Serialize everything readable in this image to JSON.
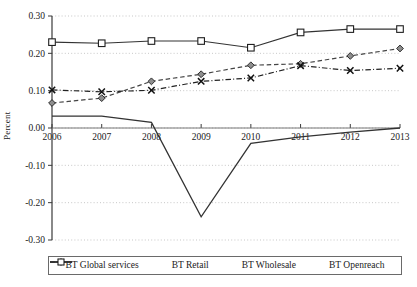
{
  "chart_data": {
    "type": "line",
    "title": "",
    "xlabel": "",
    "ylabel": "Percent",
    "x": [
      2006,
      2007,
      2008,
      2009,
      2010,
      2011,
      2012,
      2013
    ],
    "xtick_labels": [
      "2006",
      "2007",
      "2008",
      "2009",
      "2010",
      "2011",
      "2012",
      "2013"
    ],
    "ytick_labels": [
      "0.30",
      "0.20",
      "0.10",
      "0.00",
      "-0.10",
      "-0.20",
      "-0.30"
    ],
    "ytick_values": [
      0.3,
      0.2,
      0.1,
      0.0,
      -0.1,
      -0.2,
      -0.3
    ],
    "ylim": [
      -0.3,
      0.3
    ],
    "xlim": [
      2006,
      2013
    ],
    "grid": "horizontal-dotted",
    "legend_position": "bottom",
    "series": [
      {
        "name": "BT Global services",
        "style": "solid",
        "marker": "none",
        "color": "#333333",
        "values": [
          0.032,
          0.032,
          0.015,
          -0.238,
          -0.041,
          -0.024,
          -0.011,
          0.0
        ]
      },
      {
        "name": "BT Retail",
        "style": "dashed",
        "marker": "diamond",
        "color": "#444444",
        "values": [
          0.067,
          0.08,
          0.125,
          0.144,
          0.168,
          0.172,
          0.193,
          0.213
        ]
      },
      {
        "name": "BT Wholesale",
        "style": "dash-dot",
        "marker": "x",
        "color": "#222222",
        "values": [
          0.102,
          0.097,
          0.101,
          0.125,
          0.134,
          0.167,
          0.154,
          0.16
        ]
      },
      {
        "name": "BT Openreach",
        "style": "solid",
        "marker": "square",
        "color": "#333333",
        "values": [
          0.23,
          0.227,
          0.233,
          0.233,
          0.215,
          0.256,
          0.265,
          0.265
        ]
      }
    ]
  },
  "legend": {
    "items": [
      {
        "label": "BT Global services"
      },
      {
        "label": "BT Retail"
      },
      {
        "label": "BT Wholesale"
      },
      {
        "label": "BT Openreach"
      }
    ]
  }
}
